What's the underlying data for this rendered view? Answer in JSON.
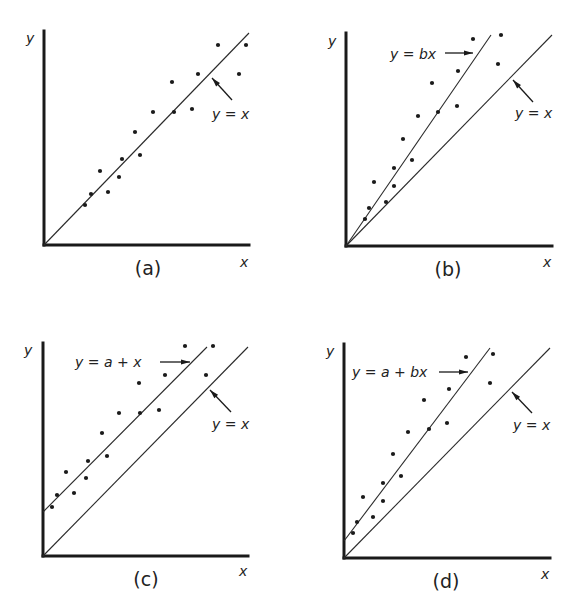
{
  "figure": {
    "panels": [
      {
        "id": "a",
        "caption": "(a)",
        "x_label": "x",
        "y_label": "y",
        "origin": [
          44,
          245
        ],
        "y_axis_top": 31,
        "x_axis_end": 249,
        "y_label_pos": [
          26,
          43
        ],
        "x_label_pos": [
          240,
          267
        ],
        "caption_pos": [
          148,
          275
        ],
        "lines": [
          {
            "name": "y = x",
            "from": [
              44,
              245
            ],
            "to": [
              249,
              33
            ]
          }
        ],
        "labels": [
          {
            "text": "y = x",
            "pos": [
              212,
              119
            ],
            "arrow_from": [
              232,
              100
            ],
            "arrow_to": [
              212,
              78
            ]
          }
        ],
        "points": [
          [
            85,
            205
          ],
          [
            91,
            194
          ],
          [
            100,
            171
          ],
          [
            108,
            192
          ],
          [
            119,
            177
          ],
          [
            122,
            159
          ],
          [
            135,
            132
          ],
          [
            140,
            155
          ],
          [
            153,
            112
          ],
          [
            172,
            82
          ],
          [
            174,
            112
          ],
          [
            192,
            109
          ],
          [
            198,
            74
          ],
          [
            218,
            45
          ],
          [
            239,
            74
          ],
          [
            246,
            45
          ]
        ]
      },
      {
        "id": "b",
        "caption": "(b)",
        "x_label": "x",
        "y_label": "y",
        "origin": [
          346,
          246
        ],
        "y_axis_top": 33,
        "x_axis_end": 552,
        "y_label_pos": [
          328,
          46
        ],
        "x_label_pos": [
          543,
          267
        ],
        "caption_pos": [
          448,
          276
        ],
        "lines": [
          {
            "name": "y = bx",
            "from": [
              346,
              246
            ],
            "to": [
              491,
              35
            ]
          },
          {
            "name": "y = x",
            "from": [
              346,
              246
            ],
            "to": [
              552,
              35
            ]
          }
        ],
        "labels": [
          {
            "text": "y = bx",
            "pos": [
              390,
              59
            ],
            "arrow_from": [
              445,
              53
            ],
            "arrow_to": [
              473,
              53
            ]
          },
          {
            "text": "y = x",
            "pos": [
              515,
              118
            ],
            "arrow_from": [
              533,
              102
            ],
            "arrow_to": [
              513,
              80
            ]
          }
        ],
        "points": [
          [
            365,
            219
          ],
          [
            369,
            208
          ],
          [
            374,
            182
          ],
          [
            386,
            202
          ],
          [
            394,
            186
          ],
          [
            394,
            168
          ],
          [
            403,
            139
          ],
          [
            412,
            160
          ],
          [
            418,
            116
          ],
          [
            438,
            112
          ],
          [
            432,
            83
          ],
          [
            457,
            106
          ],
          [
            458,
            71
          ],
          [
            473,
            39
          ],
          [
            498,
            64
          ],
          [
            501,
            35
          ]
        ]
      },
      {
        "id": "c",
        "caption": "(c)",
        "x_label": "x",
        "y_label": "y",
        "origin": [
          43,
          556
        ],
        "y_axis_top": 343,
        "x_axis_end": 248,
        "y_label_pos": [
          24,
          355
        ],
        "x_label_pos": [
          239,
          576
        ],
        "caption_pos": [
          146,
          586
        ],
        "lines": [
          {
            "name": "y = a + x",
            "from": [
              43,
              512
            ],
            "to": [
              207,
              347
            ]
          },
          {
            "name": "y = x",
            "from": [
              43,
              556
            ],
            "to": [
              248,
              347
            ]
          }
        ],
        "labels": [
          {
            "text": "y = a + x",
            "pos": [
              75,
              367
            ],
            "arrow_from": [
              160,
              362
            ],
            "arrow_to": [
              190,
              362
            ]
          },
          {
            "text": "y = x",
            "pos": [
              212,
              429
            ],
            "arrow_from": [
              231,
              412
            ],
            "arrow_to": [
              210,
              390
            ]
          }
        ],
        "points": [
          [
            52,
            507
          ],
          [
            57,
            495
          ],
          [
            66,
            472
          ],
          [
            74,
            493
          ],
          [
            86,
            478
          ],
          [
            88,
            461
          ],
          [
            102,
            433
          ],
          [
            107,
            456
          ],
          [
            119,
            413
          ],
          [
            139,
            383
          ],
          [
            140,
            413
          ],
          [
            159,
            410
          ],
          [
            165,
            375
          ],
          [
            185,
            346
          ],
          [
            206,
            375
          ],
          [
            213,
            346
          ]
        ]
      },
      {
        "id": "d",
        "caption": "(d)",
        "x_label": "x",
        "y_label": "y",
        "origin": [
          344,
          558
        ],
        "y_axis_top": 344,
        "x_axis_end": 550,
        "y_label_pos": [
          326,
          356
        ],
        "x_label_pos": [
          541,
          579
        ],
        "caption_pos": [
          446,
          588
        ],
        "lines": [
          {
            "name": "y = a + bx",
            "from": [
              344,
              541
            ],
            "to": [
              490,
              348
            ]
          },
          {
            "name": "y = x",
            "from": [
              344,
              558
            ],
            "to": [
              550,
              348
            ]
          }
        ],
        "labels": [
          {
            "text": "y = a + bx",
            "pos": [
              352,
              377
            ],
            "arrow_from": [
              439,
              372
            ],
            "arrow_to": [
              468,
              372
            ]
          },
          {
            "text": "y = x",
            "pos": [
              513,
              430
            ],
            "arrow_from": [
              532,
              413
            ],
            "arrow_to": [
              512,
              392
            ]
          }
        ],
        "points": [
          [
            353,
            533
          ],
          [
            357,
            522
          ],
          [
            363,
            497
          ],
          [
            373,
            517
          ],
          [
            383,
            501
          ],
          [
            383,
            483
          ],
          [
            393,
            454
          ],
          [
            401,
            476
          ],
          [
            408,
            432
          ],
          [
            429,
            429
          ],
          [
            424,
            400
          ],
          [
            447,
            423
          ],
          [
            449,
            389
          ],
          [
            466,
            357
          ],
          [
            490,
            383
          ],
          [
            493,
            354
          ]
        ]
      }
    ]
  },
  "chart_data": [
    {
      "type": "scatter",
      "title": "(a)",
      "xlabel": "x",
      "ylabel": "y",
      "reference_lines": [
        "y = x"
      ],
      "annotations": [
        "y = x"
      ],
      "grid": false,
      "x": [
        0.2,
        0.23,
        0.27,
        0.31,
        0.36,
        0.38,
        0.44,
        0.47,
        0.53,
        0.62,
        0.63,
        0.72,
        0.75,
        0.85,
        0.95,
        0.98
      ],
      "y": [
        0.19,
        0.24,
        0.35,
        0.25,
        0.32,
        0.41,
        0.53,
        0.42,
        0.63,
        0.77,
        0.63,
        0.64,
        0.81,
        0.94,
        0.81,
        0.94
      ]
    },
    {
      "type": "scatter",
      "title": "(b)",
      "xlabel": "x",
      "ylabel": "y",
      "reference_lines": [
        "y = bx",
        "y = x"
      ],
      "annotations": [
        "y = bx",
        "y = x"
      ],
      "grid": false,
      "x": [
        0.09,
        0.11,
        0.14,
        0.19,
        0.23,
        0.23,
        0.28,
        0.32,
        0.35,
        0.45,
        0.42,
        0.54,
        0.54,
        0.62,
        0.74,
        0.75
      ],
      "y": [
        0.13,
        0.18,
        0.3,
        0.21,
        0.28,
        0.36,
        0.5,
        0.4,
        0.61,
        0.63,
        0.76,
        0.65,
        0.82,
        0.97,
        0.85,
        0.99
      ]
    },
    {
      "type": "scatter",
      "title": "(c)",
      "xlabel": "x",
      "ylabel": "y",
      "reference_lines": [
        "y = a + x",
        "y = x"
      ],
      "annotations": [
        "y = a + x",
        "y = x"
      ],
      "grid": false,
      "x": [
        0.04,
        0.07,
        0.11,
        0.15,
        0.21,
        0.22,
        0.29,
        0.31,
        0.37,
        0.47,
        0.47,
        0.56,
        0.59,
        0.69,
        0.79,
        0.83
      ],
      "y": [
        0.24,
        0.29,
        0.4,
        0.3,
        0.37,
        0.45,
        0.58,
        0.47,
        0.67,
        0.82,
        0.67,
        0.69,
        0.86,
        1.0,
        0.86,
        1.0
      ]
    },
    {
      "type": "scatter",
      "title": "(d)",
      "xlabel": "x",
      "ylabel": "y",
      "reference_lines": [
        "y = a + bx",
        "y = x"
      ],
      "annotations": [
        "y = a + bx",
        "y = x"
      ],
      "grid": false,
      "x": [
        0.04,
        0.06,
        0.09,
        0.14,
        0.19,
        0.19,
        0.24,
        0.28,
        0.31,
        0.41,
        0.39,
        0.5,
        0.51,
        0.59,
        0.71,
        0.72
      ],
      "y": [
        0.12,
        0.17,
        0.29,
        0.2,
        0.27,
        0.36,
        0.49,
        0.39,
        0.59,
        0.61,
        0.74,
        0.63,
        0.79,
        0.94,
        0.82,
        0.96
      ]
    }
  ]
}
